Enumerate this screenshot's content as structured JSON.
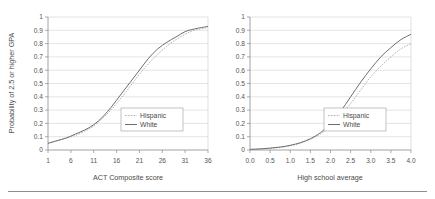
{
  "figure": {
    "name": "two-panel-probability-curves",
    "background_color": "#ffffff",
    "divider_color": "#8e8e8e"
  },
  "style": {
    "white_color": "#6e6e6e",
    "hispanic_color": "#a8a8a8",
    "grid_color": "#d2d2d2",
    "axis_color": "#8a8a8a"
  },
  "chart_data": [
    {
      "type": "line",
      "title": "",
      "xlabel": "ACT Composite score",
      "ylabel": "Probability of 2.5 or higher GPA",
      "xlim": [
        1,
        36
      ],
      "ylim": [
        0,
        1
      ],
      "grid": true,
      "legend_position": "bottom-right",
      "xticks": [
        "1",
        "6",
        "11",
        "16",
        "21",
        "26",
        "31",
        "36"
      ],
      "xtick_values": [
        1,
        6,
        11,
        16,
        21,
        26,
        31,
        36
      ],
      "yticks": [
        "0",
        "0.1",
        "0.2",
        "0.3",
        "0.4",
        "0.5",
        "0.6",
        "0.7",
        "0.8",
        "0.9",
        "1"
      ],
      "ytick_values": [
        0,
        0.1,
        0.2,
        0.3,
        0.4,
        0.5,
        0.6,
        0.7,
        0.8,
        0.9,
        1
      ],
      "x": [
        1,
        3,
        5,
        7,
        9,
        11,
        13,
        15,
        17,
        19,
        21,
        23,
        25,
        27,
        29,
        31,
        33,
        36
      ],
      "series": [
        {
          "name": "Hispanic",
          "style": "dotted",
          "values": [
            0.05,
            0.07,
            0.09,
            0.11,
            0.14,
            0.18,
            0.24,
            0.31,
            0.39,
            0.48,
            0.57,
            0.65,
            0.72,
            0.78,
            0.83,
            0.87,
            0.9,
            0.92
          ]
        },
        {
          "name": "White",
          "style": "solid",
          "values": [
            0.05,
            0.07,
            0.09,
            0.12,
            0.15,
            0.19,
            0.25,
            0.33,
            0.42,
            0.51,
            0.6,
            0.69,
            0.76,
            0.81,
            0.85,
            0.89,
            0.91,
            0.93
          ]
        }
      ]
    },
    {
      "type": "line",
      "title": "",
      "xlabel": "High school average",
      "ylabel": "",
      "xlim": [
        0,
        4
      ],
      "ylim": [
        0,
        1
      ],
      "grid": true,
      "legend_position": "bottom-right",
      "xticks": [
        "0.0",
        "0.5",
        "1.0",
        "1.5",
        "2.0",
        "2.5",
        "3.0",
        "3.5",
        "4.0"
      ],
      "xtick_values": [
        0.0,
        0.5,
        1.0,
        1.5,
        2.0,
        2.5,
        3.0,
        3.5,
        4.0
      ],
      "yticks": [
        "0",
        "0.1",
        "0.2",
        "0.3",
        "0.4",
        "0.5",
        "0.6",
        "0.7",
        "0.8",
        "0.9",
        "1"
      ],
      "ytick_values": [
        0,
        0.1,
        0.2,
        0.3,
        0.4,
        0.5,
        0.6,
        0.7,
        0.8,
        0.9,
        1
      ],
      "x": [
        0.0,
        0.25,
        0.5,
        0.75,
        1.0,
        1.25,
        1.5,
        1.75,
        2.0,
        2.25,
        2.5,
        2.75,
        3.0,
        3.25,
        3.5,
        3.75,
        4.0
      ],
      "series": [
        {
          "name": "Hispanic",
          "style": "dotted",
          "values": [
            0.005,
            0.008,
            0.013,
            0.02,
            0.032,
            0.05,
            0.08,
            0.12,
            0.18,
            0.26,
            0.35,
            0.45,
            0.55,
            0.63,
            0.7,
            0.76,
            0.8
          ]
        },
        {
          "name": "White",
          "style": "solid",
          "values": [
            0.005,
            0.008,
            0.014,
            0.022,
            0.035,
            0.055,
            0.085,
            0.13,
            0.2,
            0.29,
            0.4,
            0.51,
            0.61,
            0.7,
            0.77,
            0.83,
            0.87
          ]
        }
      ]
    }
  ]
}
